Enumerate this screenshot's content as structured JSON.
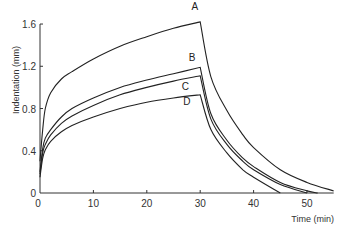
{
  "chart_data": {
    "type": "line",
    "title": "",
    "xlabel": "Time (min)",
    "ylabel": "Indentation (mm)",
    "xlim": [
      0,
      55
    ],
    "ylim": [
      0,
      1.6
    ],
    "x_ticks": [
      0,
      10,
      20,
      30,
      40,
      50
    ],
    "y_ticks": [
      0,
      0.4,
      0.8,
      1.2,
      1.6
    ],
    "x_tick_labels": [
      "0",
      "10",
      "20",
      "30",
      "40",
      "50"
    ],
    "y_tick_labels": [
      "0",
      "0.4",
      "0.8",
      "1.2",
      "1.6"
    ],
    "grid": false,
    "legend": "inline curve labels",
    "series": [
      {
        "name": "A",
        "x": [
          0,
          0.5,
          1,
          2,
          4,
          6,
          10,
          15,
          20,
          25,
          30,
          30,
          32,
          35,
          38,
          40,
          45,
          50,
          55
        ],
        "values": [
          0.3,
          0.6,
          0.8,
          0.95,
          1.08,
          1.15,
          1.27,
          1.39,
          1.48,
          1.56,
          1.62,
          1.62,
          1.1,
          0.78,
          0.55,
          0.43,
          0.22,
          0.1,
          0.02
        ]
      },
      {
        "name": "B",
        "x": [
          0,
          0.5,
          1,
          2,
          4,
          6,
          10,
          15,
          20,
          25,
          30,
          30,
          32,
          35,
          38,
          40,
          45,
          50,
          52
        ],
        "values": [
          0.2,
          0.42,
          0.52,
          0.6,
          0.72,
          0.8,
          0.9,
          1.0,
          1.07,
          1.13,
          1.19,
          1.19,
          0.75,
          0.5,
          0.33,
          0.25,
          0.1,
          0.02,
          0.0
        ]
      },
      {
        "name": "C",
        "x": [
          0,
          0.5,
          1,
          2,
          4,
          6,
          10,
          15,
          20,
          25,
          30,
          30,
          32,
          35,
          38,
          40,
          45,
          50
        ],
        "values": [
          0.18,
          0.38,
          0.46,
          0.55,
          0.66,
          0.73,
          0.83,
          0.93,
          1.0,
          1.06,
          1.11,
          1.11,
          0.7,
          0.46,
          0.3,
          0.22,
          0.08,
          0.0
        ]
      },
      {
        "name": "D",
        "x": [
          0,
          0.5,
          1,
          2,
          4,
          6,
          10,
          15,
          20,
          25,
          30,
          30,
          32,
          35,
          38,
          40,
          45
        ],
        "values": [
          0.15,
          0.33,
          0.41,
          0.49,
          0.58,
          0.64,
          0.72,
          0.8,
          0.86,
          0.9,
          0.93,
          0.93,
          0.6,
          0.38,
          0.22,
          0.15,
          0.0
        ]
      }
    ],
    "annotations": [
      "A",
      "B",
      "C",
      "D"
    ]
  }
}
